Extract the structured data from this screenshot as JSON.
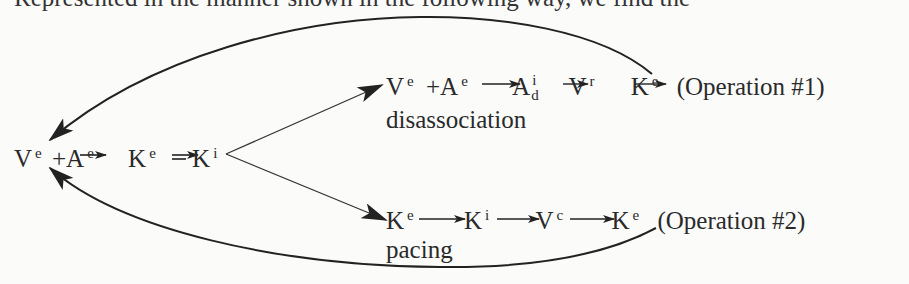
{
  "header_fragment": "Represented in the manner shown in the following way, we find the",
  "start_chain": {
    "nodes": [
      {
        "base": "V",
        "sup": "e"
      },
      {
        "op": "+"
      },
      {
        "base": "A",
        "sup": "e"
      },
      {
        "arrow": "→"
      },
      {
        "base": "K",
        "sup": "e"
      },
      {
        "arrow": "⇌"
      },
      {
        "base": "K",
        "sup": "i"
      }
    ]
  },
  "operation1": {
    "nodes": [
      {
        "base": "V",
        "sup": "e"
      },
      {
        "op": "+"
      },
      {
        "base": "A",
        "sup": "e"
      },
      {
        "arrow": "→"
      },
      {
        "base": "A",
        "sup": "i",
        "sub": "d"
      },
      {
        "arrow": "→"
      },
      {
        "base": "V",
        "sup": "r"
      },
      {
        "arrow": "→"
      },
      {
        "base": "K",
        "sup": "e"
      }
    ],
    "label": "(Operation #1)",
    "caption": "disassociation"
  },
  "operation2": {
    "nodes": [
      {
        "base": "K",
        "sup": "e"
      },
      {
        "arrow": "→"
      },
      {
        "base": "K",
        "sup": "i"
      },
      {
        "arrow": "→"
      },
      {
        "base": "V",
        "sup": "c"
      },
      {
        "arrow": "→"
      },
      {
        "base": "K",
        "sup": "e"
      }
    ],
    "label": "(Operation #2)",
    "caption": "pacing"
  },
  "edges": [
    {
      "from": "start-K-i",
      "to": "operation1-V-e",
      "type": "branch-arrow"
    },
    {
      "from": "start-K-i",
      "to": "operation2-K-e",
      "type": "branch-arrow"
    },
    {
      "from": "operation1-end",
      "to": "start-V-e",
      "type": "feedback-curve"
    },
    {
      "from": "operation2-end",
      "to": "start-V-e",
      "type": "feedback-curve"
    }
  ]
}
